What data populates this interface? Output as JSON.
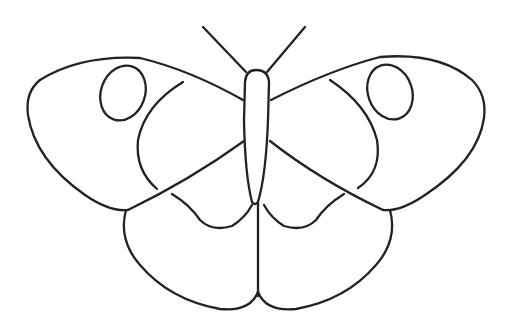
{
  "image": {
    "title": "Butterfly coloring page",
    "subject": "butterfly-line-drawing",
    "background_color": "#ffffff",
    "line_color": "#222222"
  },
  "parts": {
    "antennae": 2,
    "forewings": 2,
    "hindwings": 2,
    "wing_spots": 2
  }
}
